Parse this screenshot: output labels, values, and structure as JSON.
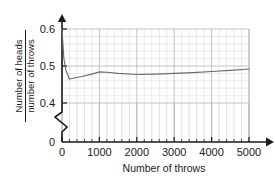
{
  "chart_data": {
    "type": "line",
    "title": "",
    "xlabel": "Number of throws",
    "ylabel_numerator": "Number of heads",
    "ylabel_denominator": "number of throws",
    "xlim": [
      0,
      5000
    ],
    "ylim": [
      0.4,
      0.6
    ],
    "y_axis_break": true,
    "y_axis_break_label": "0",
    "grid": true,
    "grid_major_x": 1000,
    "grid_minor_x": 200,
    "grid_major_y": 0.1,
    "grid_minor_y": 0.02,
    "legend": "none",
    "xticks": [
      0,
      1000,
      2000,
      3000,
      4000,
      5000
    ],
    "xtick_labels": [
      "0",
      "1000",
      "2000",
      "3000",
      "4000",
      "5000"
    ],
    "yticks": [
      0.4,
      0.5,
      0.6
    ],
    "ytick_labels": [
      "0.4",
      "0.5",
      "0.6"
    ],
    "series": [
      {
        "name": "relative frequency of heads",
        "x": [
          0,
          50,
          100,
          200,
          300,
          500,
          800,
          1000,
          1200,
          1500,
          2000,
          2500,
          3000,
          3500,
          4000,
          4500,
          5000
        ],
        "y": [
          0.6,
          0.52,
          0.49,
          0.465,
          0.467,
          0.471,
          0.478,
          0.484,
          0.483,
          0.48,
          0.477,
          0.478,
          0.48,
          0.482,
          0.485,
          0.488,
          0.492
        ]
      }
    ]
  },
  "axis_labels": {
    "x_title": "Number of throws",
    "y_numerator": "Number of heads",
    "y_denominator": "number of throws",
    "zero_label": "0"
  },
  "colors": {
    "line": "#6b6b6b",
    "axis": "#1a1a1a",
    "grid_major": "#b4b4b4",
    "grid_minor": "#dcdcdc",
    "background": "#ffffff"
  }
}
